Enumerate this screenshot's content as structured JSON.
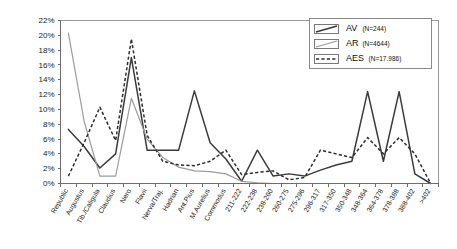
{
  "chart_data": {
    "type": "line",
    "title": "",
    "subtitle": "",
    "xlabel": "",
    "ylabel": "",
    "ylim": [
      0,
      22
    ],
    "ytick_labels": [
      "0%",
      "2%",
      "4%",
      "6%",
      "8%",
      "10%",
      "12%",
      "14%",
      "16%",
      "18%",
      "20%",
      "22%"
    ],
    "ytick_values": [
      0,
      2,
      4,
      6,
      8,
      10,
      12,
      14,
      16,
      18,
      20,
      22
    ],
    "grid": false,
    "legend_position": "top-right",
    "categories": [
      "Republic",
      "Augustus",
      "Tib./Caligula",
      "Claudius",
      "Nero",
      "Flavii",
      "Nerva/Traj.",
      "Hadrian",
      "Ant.Pius",
      "M.Aurelius",
      "Commodus",
      "211-222",
      "222-238",
      "238-260",
      "260-275",
      "275-296",
      "296-317",
      "317-350",
      "350-348",
      "348-364",
      "364-378",
      "378-388",
      "388-402",
      ">402"
    ],
    "series": [
      {
        "name": "AV",
        "legend_label": "AV",
        "count_label": "(N=244)",
        "style": "solid-dark",
        "color": "#3b3b3b",
        "values": [
          7.3,
          5.0,
          2.1,
          4.0,
          17.0,
          4.5,
          4.5,
          4.5,
          12.5,
          5.5,
          3.3,
          0.3,
          4.5,
          1.0,
          1.3,
          1.0,
          1.8,
          2.5,
          3.0,
          12.4,
          3.0,
          12.4,
          1.3,
          0.0
        ]
      },
      {
        "name": "AR",
        "legend_label": "AR",
        "count_label": "(N=4644)",
        "style": "solid-gray",
        "color": "#9c9c9c",
        "values": [
          20.3,
          8.4,
          1.0,
          1.0,
          11.5,
          6.0,
          3.5,
          2.2,
          1.7,
          1.6,
          1.3,
          0.3,
          0.1,
          0.0,
          0.0,
          0.0,
          0.0,
          0.0,
          0.0,
          0.0,
          0.0,
          0.0,
          0.0,
          0.0
        ]
      },
      {
        "name": "AES",
        "legend_label": "AES",
        "count_label": "(N=17.986)",
        "style": "dashed",
        "color": "#2e2e2e",
        "values": [
          1.0,
          5.5,
          10.3,
          5.8,
          19.5,
          6.5,
          3.0,
          2.5,
          2.4,
          3.0,
          4.5,
          1.2,
          1.5,
          1.7,
          0.5,
          0.8,
          4.5,
          4.0,
          3.5,
          6.2,
          4.0,
          6.2,
          4.0,
          0.0
        ]
      }
    ]
  }
}
